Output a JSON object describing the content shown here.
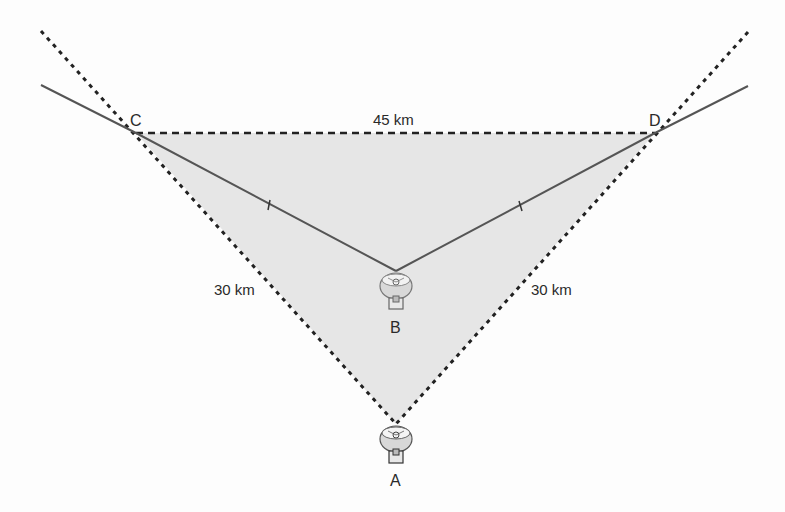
{
  "diagram": {
    "type": "geometry-triangle-with-antennas",
    "colors": {
      "background": "#fdfdfd",
      "triangle_fill": "#e6e6e6",
      "dotted_line": "#222222",
      "solid_line": "#555555",
      "text": "#2a2a2a"
    },
    "points": {
      "A": {
        "label": "A",
        "x": 396,
        "y": 424,
        "has_antenna": true
      },
      "B": {
        "label": "B",
        "x": 396,
        "y": 271,
        "has_antenna": true
      },
      "C": {
        "label": "C",
        "x": 136,
        "y": 133
      },
      "D": {
        "label": "D",
        "x": 655,
        "y": 133
      }
    },
    "segments": {
      "CD": {
        "label": "45 km",
        "style": "dashed"
      },
      "AC": {
        "label": "30 km",
        "style": "dotted"
      },
      "AD": {
        "label": "30 km",
        "style": "dotted"
      },
      "CB": {
        "style": "solid",
        "tick_marks": 1
      },
      "DB": {
        "style": "solid",
        "tick_marks": 1
      }
    },
    "labels": {
      "cd_length": "45 km",
      "ac_length": "30 km",
      "ad_length": "30 km",
      "point_a": "A",
      "point_b": "B",
      "point_c": "C",
      "point_d": "D"
    }
  }
}
